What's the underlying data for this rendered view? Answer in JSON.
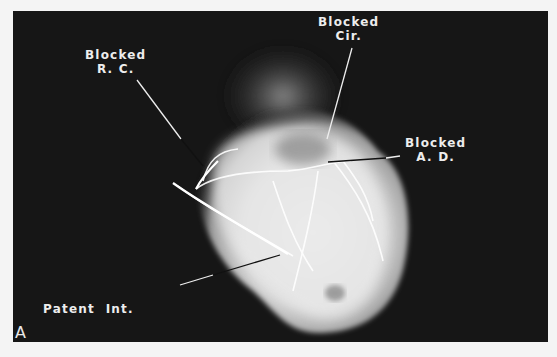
{
  "figure": {
    "panel_letter": "A",
    "background_color": "#161616",
    "page_color": "#f4f4f4"
  },
  "labels": {
    "blocked_rc": {
      "line1": "Blocked",
      "line2": "R. C."
    },
    "blocked_cir": {
      "line1": "Blocked",
      "line2": "Cir."
    },
    "blocked_ad": {
      "line1": "Blocked",
      "line2": "A. D."
    },
    "patent_ima": {
      "line1": "Patent  Int.",
      "line2": "Mammary  Art."
    }
  }
}
